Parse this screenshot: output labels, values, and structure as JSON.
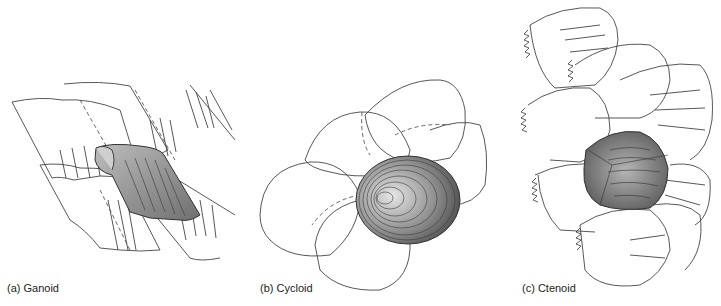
{
  "figure": {
    "panels": [
      {
        "id": "a",
        "caption": "(a) Ganoid",
        "scale_type": "ganoid",
        "colors": {
          "outline": "#444444",
          "highlight": "#8a8a8a"
        }
      },
      {
        "id": "b",
        "caption": "(b) Cycloid",
        "scale_type": "cycloid",
        "colors": {
          "outline": "#444444",
          "highlight": "#7a7a7a"
        }
      },
      {
        "id": "c",
        "caption": "(c) Ctenoid",
        "scale_type": "ctenoid",
        "colors": {
          "outline": "#444444",
          "highlight": "#6e6e6e"
        }
      }
    ]
  }
}
